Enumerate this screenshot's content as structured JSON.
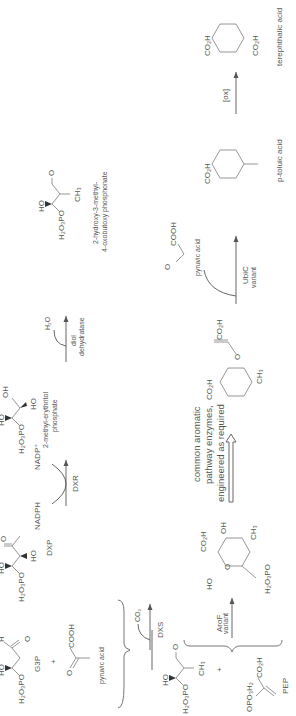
{
  "diagram": {
    "orientation": "rotated 90 degrees counter-clockwise",
    "top_pathway": {
      "reactants": [
        {
          "name": "G3P",
          "structure_labels": [
            "H2O3PO",
            "HO",
            "H",
            "O"
          ]
        },
        {
          "name": "pyruvic acid",
          "structure_labels": [
            "O",
            "COOH"
          ]
        }
      ],
      "plus": "+",
      "steps": [
        {
          "enzyme": "DXS",
          "side_product": "CO2",
          "product": {
            "name": "DXP",
            "structure_labels": [
              "H2O3PO",
              "HO",
              "HO",
              "O"
            ]
          }
        },
        {
          "enzyme": "DXR",
          "cofactor_in": "NADPH",
          "cofactor_out": "NADP+",
          "product": {
            "name": "2-methyl-erythritol phosphate",
            "name_line1": "2-methyl-erythritol",
            "name_line2": "phosphate",
            "structure_labels": [
              "H2O3PO",
              "HO",
              "OH",
              "HO"
            ]
          }
        },
        {
          "enzyme": "diol dehydratase",
          "enzyme_line1": "diol",
          "enzyme_line2": "dehydratase",
          "side_product": "H2O",
          "product": {
            "name": "2-hydroxy-3-methyl-4-oxobutoxy phosphonate",
            "name_line1": "2-hydroxy-3-methyl-",
            "name_line2": "4-oxobutoxy phosphonate",
            "structure_labels": [
              "H2O3PO",
              "HO",
              "O",
              "CH3"
            ]
          }
        }
      ]
    },
    "bottom_pathway": {
      "reactants": [
        {
          "name": "2-hydroxy-3-methyl-4-oxobutoxy phosphonate",
          "structure_labels": [
            "H2O3PO",
            "HO",
            "O",
            "CH3"
          ]
        },
        {
          "name": "PEP",
          "structure_labels": [
            "OPO3H2",
            "CO2H"
          ]
        }
      ],
      "plus": "+",
      "steps": [
        {
          "enzyme": "AroF variant",
          "enzyme_line1": "AroF",
          "enzyme_line2": "variant",
          "product": {
            "name": "sugar intermediate",
            "structure_labels": [
              "HO",
              "CO2H",
              "O",
              "OH",
              "CH3",
              "H2O3PO"
            ]
          }
        },
        {
          "enzyme": "common aromatic pathway enzymes, engineered as required",
          "enzyme_line1": "common aromatic",
          "enzyme_line2": "pathway enzymes,",
          "enzyme_line3": "engineered as required",
          "product": {
            "name": "chorismate analog",
            "structure_labels": [
              "CO2H",
              "O",
              "CO2H",
              "CH3"
            ]
          }
        },
        {
          "enzyme": "UbiC variant",
          "enzyme_line1": "UbiC",
          "enzyme_line2": "variant",
          "side_product": "pyruvic acid",
          "side_product_labels": [
            "O",
            "COOH"
          ],
          "product": {
            "name": "p-toluic acid",
            "structure_labels": [
              "CO2H"
            ]
          }
        },
        {
          "enzyme": "[ox]",
          "product": {
            "name": "terephthalic acid",
            "structure_labels": [
              "CO2H",
              "CO2H"
            ]
          }
        }
      ]
    }
  },
  "text": {
    "h2o3po": "H₂O₃PO",
    "ho": "HO",
    "oh": "OH",
    "o": "O",
    "h": "H",
    "cooh": "COOH",
    "co2h": "CO₂H",
    "ch3": "CH₃",
    "co2": "CO₂",
    "h2o": "H₂O",
    "opo3h2": "OPO₃H₂",
    "plus": "+",
    "g3p": "G3P",
    "pyruvic": "pyruvic acid",
    "dxs": "DXS",
    "dxp": "DXP",
    "nadph": "NADPH",
    "nadp": "NADP⁺",
    "dxr": "DXR",
    "mep1": "2-methyl-erythritol",
    "mep2": "phosphate",
    "diol1": "diol",
    "diol2": "dehydratase",
    "hmb1": "2-hydroxy-3-methyl-",
    "hmb2": "4-oxobutoxy phosphonate",
    "arof1": "AroF",
    "arof2": "variant",
    "pep": "PEP",
    "common1": "common aromatic",
    "common2": "pathway enzymes,",
    "common3": "engineered as required",
    "ubic1": "UbiC",
    "ubic2": "variant",
    "ptol": "p-toluic acid",
    "ox": "[ox]",
    "tpa": "terephthalic acid"
  }
}
